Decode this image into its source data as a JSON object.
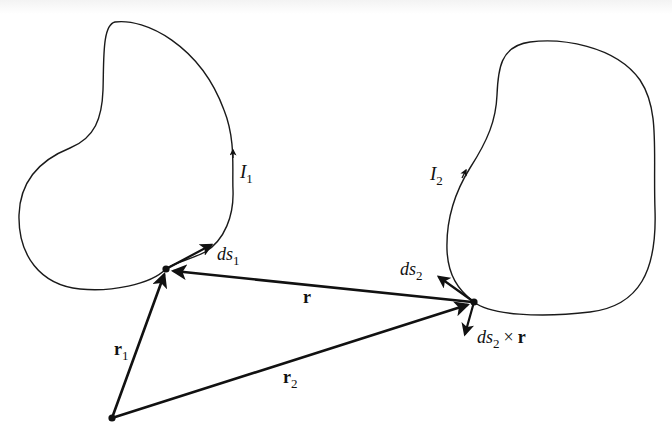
{
  "figure": {
    "loop1": {
      "current_label": "I",
      "current_sub": "1",
      "element_label": "ds",
      "element_sub": "1"
    },
    "loop2": {
      "current_label": "I",
      "current_sub": "2",
      "element_label": "ds",
      "element_sub": "2"
    },
    "vectors": {
      "r": {
        "label": "r"
      },
      "r1": {
        "label": "r",
        "sub": "1"
      },
      "r2": {
        "label": "r",
        "sub": "2"
      },
      "cross": {
        "label_a": "ds",
        "sub": "2",
        "op": "×",
        "label_b": "r"
      }
    },
    "colors": {
      "ink": "#111111",
      "background": "#ffffff"
    }
  }
}
